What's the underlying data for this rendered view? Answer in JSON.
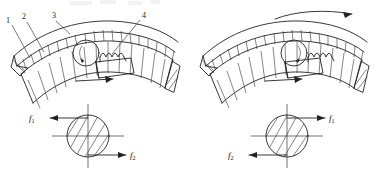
{
  "figure": {
    "background_color": "#ffffff",
    "line_color": "#222222"
  },
  "callouts": {
    "item1": "1",
    "item2": "2",
    "item3": "3",
    "item4": "4"
  },
  "left_view": {
    "name": "left-clutch-view",
    "forces": {
      "f1": "f",
      "f1_sub": "1",
      "f1_direction": "left",
      "f2": "f",
      "f2_sub": "2",
      "f2_direction": "right"
    },
    "inner_arrow_direction": "right",
    "has_rotation_arrow": false
  },
  "right_view": {
    "name": "right-clutch-view",
    "forces": {
      "f1": "f",
      "f1_sub": "1",
      "f1_direction": "right",
      "f2": "f",
      "f2_sub": "2",
      "f2_direction": "left"
    },
    "inner_arrow_direction": "right",
    "has_rotation_arrow": true,
    "rotation_arrow_direction": "clockwise-right"
  }
}
